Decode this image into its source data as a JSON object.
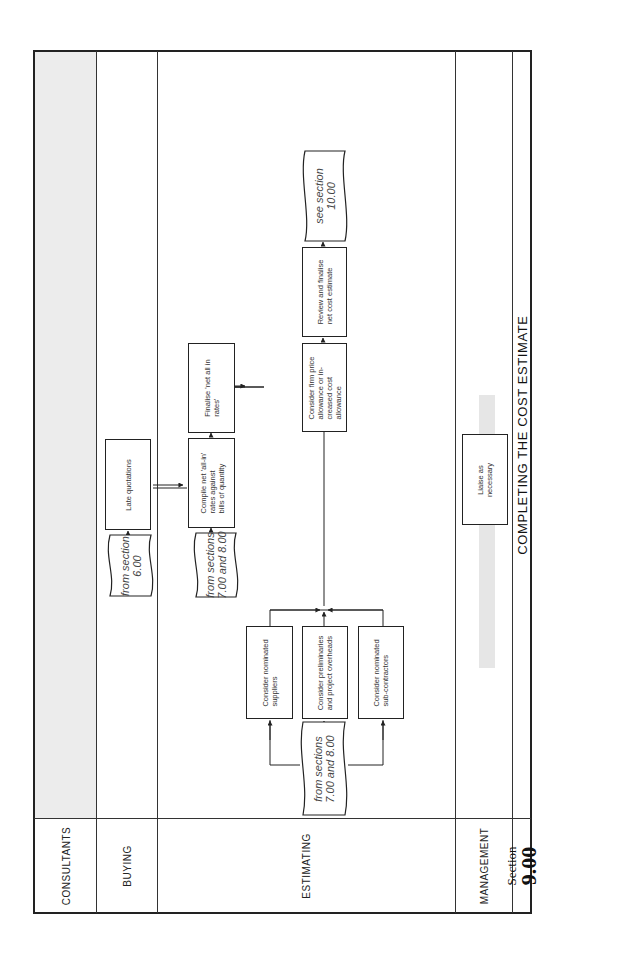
{
  "lanes": {
    "consultants": "CONSULTANTS",
    "buying": "BUYING",
    "estimating": "ESTIMATING",
    "management": "MANAGEMENT"
  },
  "section": {
    "label": "Section",
    "number": "9.00"
  },
  "title": "COMPLETING THE COST ESTIMATE",
  "buying": {
    "from_doc": [
      "from section",
      "6.00"
    ],
    "late_quotations": "Late quotations"
  },
  "estimating": {
    "from_doc_left": [
      "from sections",
      "7.00 and 8.00"
    ],
    "consider_suppliers": [
      "Consider nominated",
      "suppliers"
    ],
    "consider_preliminaries": [
      "Consider preliminaries",
      "and project overheads"
    ],
    "consider_subcontractors": [
      "Consider nominated",
      "sub-contractors"
    ],
    "from_doc_mid": [
      "from sections",
      "7.00 and 8.00"
    ],
    "compile_rates": [
      "Compile net 'all-in'",
      "rates against",
      "bills of quantity"
    ],
    "finalise_rates": [
      "Finalise 'net all in",
      "rates'"
    ],
    "firm_price": [
      "Consider firm price",
      "allowance or in-",
      "creased cost",
      "allowance"
    ],
    "review_finalise": [
      "Review and finalise",
      "net cost estimate"
    ],
    "see_doc": [
      "see section",
      "10.00"
    ]
  },
  "management": {
    "liaise": [
      "Liaise as",
      "necessary"
    ]
  },
  "colors": {
    "line": "#222222",
    "shade": "#ececec",
    "band": "#e6e6e6"
  }
}
